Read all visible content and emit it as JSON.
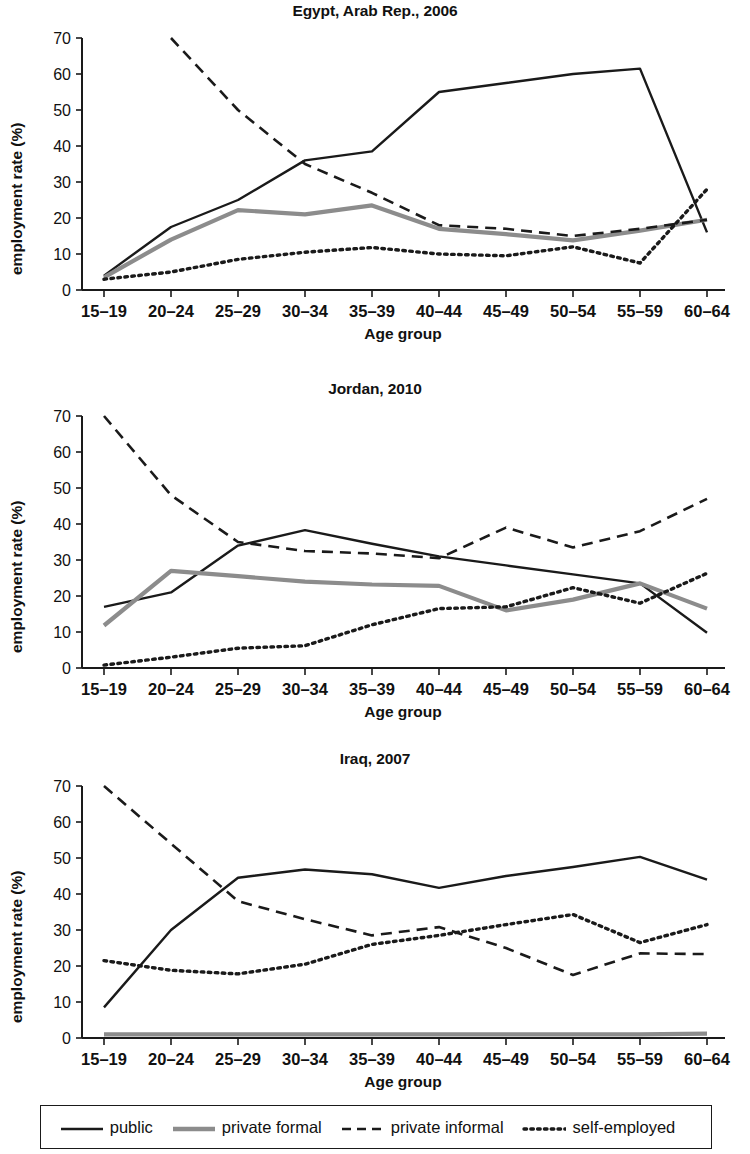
{
  "figure": {
    "axis_label_y": "employment rate (%)",
    "axis_label_x": "Age group",
    "categories": [
      "15–19",
      "20–24",
      "25–29",
      "30–34",
      "35–39",
      "40–44",
      "45–49",
      "50–54",
      "55–59",
      "60–64"
    ],
    "yticks": [
      "0",
      "10",
      "20",
      "30",
      "40",
      "50",
      "60",
      "70"
    ],
    "legend": {
      "items": [
        {
          "label": "public",
          "style": "solid",
          "color": "#1a1a1a",
          "swatch": "legend-line-solid-black"
        },
        {
          "label": "private formal",
          "style": "solid",
          "color": "#8c8c8c",
          "swatch": "legend-line-solid-gray"
        },
        {
          "label": "private informal",
          "style": "dashed",
          "color": "#1a1a1a",
          "swatch": "legend-line-dashed"
        },
        {
          "label": "self-employed",
          "style": "dotted",
          "color": "#1a1a1a",
          "swatch": "legend-line-dotted"
        }
      ]
    }
  },
  "chart_data": [
    {
      "type": "line",
      "title": "Egypt, Arab Rep., 2006",
      "xlabel": "Age group",
      "ylabel": "employment rate (%)",
      "categories": [
        "15–19",
        "20–24",
        "25–29",
        "30–34",
        "35–39",
        "40–44",
        "45–49",
        "50–54",
        "55–59",
        "60–64"
      ],
      "ylim": [
        0,
        70
      ],
      "yticks": [
        0,
        10,
        20,
        30,
        40,
        50,
        60,
        70
      ],
      "grid": false,
      "legend_position": "bottom",
      "series": [
        {
          "name": "public",
          "style": "solid",
          "color": "#1a1a1a",
          "values": [
            4.0,
            17.5,
            25.0,
            36.0,
            38.5,
            55.0,
            57.5,
            60.0,
            61.5,
            16.0
          ]
        },
        {
          "name": "private formal",
          "style": "solid",
          "color": "#8c8c8c",
          "values": [
            3.5,
            14.0,
            22.2,
            21.0,
            23.5,
            17.0,
            15.5,
            13.8,
            16.5,
            19.5
          ]
        },
        {
          "name": "private informal",
          "style": "dashed",
          "color": "#1a1a1a",
          "values": [
            null,
            70.0,
            50.0,
            35.0,
            27.0,
            18.0,
            17.0,
            15.0,
            17.0,
            19.5
          ]
        },
        {
          "name": "self-employed",
          "style": "dotted",
          "color": "#1a1a1a",
          "values": [
            3.0,
            5.0,
            8.5,
            10.5,
            11.8,
            10.0,
            9.5,
            12.0,
            7.5,
            28.0
          ]
        }
      ]
    },
    {
      "type": "line",
      "title": "Jordan, 2010",
      "xlabel": "Age group",
      "ylabel": "employment rate (%)",
      "categories": [
        "15–19",
        "20–24",
        "25–29",
        "30–34",
        "35–39",
        "40–44",
        "45–49",
        "50–54",
        "55–59",
        "60–64"
      ],
      "ylim": [
        0,
        70
      ],
      "yticks": [
        0,
        10,
        20,
        30,
        40,
        50,
        60,
        70
      ],
      "grid": false,
      "legend_position": "bottom",
      "series": [
        {
          "name": "public",
          "style": "solid",
          "color": "#1a1a1a",
          "values": [
            17.0,
            21.0,
            34.0,
            38.3,
            34.5,
            31.0,
            28.5,
            26.0,
            23.5,
            9.8
          ]
        },
        {
          "name": "private formal",
          "style": "solid",
          "color": "#8c8c8c",
          "values": [
            11.8,
            27.0,
            25.5,
            24.0,
            23.2,
            22.8,
            16.0,
            19.0,
            23.5,
            16.5
          ]
        },
        {
          "name": "private informal",
          "style": "dashed",
          "color": "#1a1a1a",
          "values": [
            70.0,
            48.0,
            35.0,
            32.5,
            31.8,
            30.5,
            39.0,
            33.5,
            38.0,
            47.0
          ]
        },
        {
          "name": "self-employed",
          "style": "dotted",
          "color": "#1a1a1a",
          "values": [
            0.8,
            3.0,
            5.5,
            6.2,
            12.0,
            16.5,
            17.0,
            22.3,
            18.0,
            26.3
          ]
        }
      ]
    },
    {
      "type": "line",
      "title": "Iraq, 2007",
      "xlabel": "Age group",
      "ylabel": "employment rate (%)",
      "categories": [
        "15–19",
        "20–24",
        "25–29",
        "30–34",
        "35–39",
        "40–44",
        "45–49",
        "50–54",
        "55–59",
        "60–64"
      ],
      "ylim": [
        0,
        70
      ],
      "yticks": [
        0,
        10,
        20,
        30,
        40,
        50,
        60,
        70
      ],
      "grid": false,
      "legend_position": "bottom",
      "series": [
        {
          "name": "public",
          "style": "solid",
          "color": "#1a1a1a",
          "values": [
            8.5,
            30.0,
            44.5,
            46.8,
            45.5,
            41.7,
            45.0,
            47.5,
            50.3,
            44.0
          ]
        },
        {
          "name": "private formal",
          "style": "solid",
          "color": "#8c8c8c",
          "values": [
            1.0,
            1.0,
            1.0,
            1.0,
            1.0,
            1.0,
            1.0,
            1.0,
            1.0,
            1.2
          ]
        },
        {
          "name": "private informal",
          "style": "dashed",
          "color": "#1a1a1a",
          "values": [
            70.0,
            54.0,
            38.0,
            33.0,
            28.5,
            30.8,
            25.0,
            17.5,
            23.5,
            23.3
          ]
        },
        {
          "name": "self-employed",
          "style": "dotted",
          "color": "#1a1a1a",
          "values": [
            21.5,
            18.8,
            17.8,
            20.5,
            26.0,
            28.5,
            31.5,
            34.3,
            26.5,
            31.5
          ]
        }
      ]
    }
  ]
}
